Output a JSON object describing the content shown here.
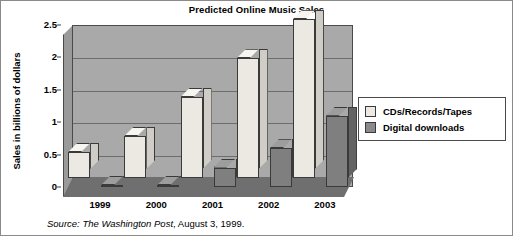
{
  "chart_data": {
    "type": "bar",
    "title": "Predicted Online Music Sales",
    "xlabel": "",
    "ylabel": "Sales in billions of dollars",
    "categories": [
      "1999",
      "2000",
      "2001",
      "2002",
      "2003"
    ],
    "series": [
      {
        "name": "CDs/Records/Tapes",
        "values": [
          0.4,
          0.65,
          1.25,
          1.85,
          2.45
        ],
        "color": "#ebe9e2"
      },
      {
        "name": "Digital downloads",
        "values": [
          0.02,
          0.03,
          0.3,
          0.6,
          1.1
        ],
        "color": "#7f7f7f"
      }
    ],
    "ylim": [
      0,
      2.5
    ],
    "yticks": [
      "0",
      "0.5",
      "1",
      "1.5",
      "2",
      "2.5"
    ],
    "ytick_values": [
      0,
      0.5,
      1,
      1.5,
      2,
      2.5
    ],
    "grid": true,
    "legend_position": "right",
    "style": "3d-column",
    "plot_background": "#a9a9a9"
  },
  "source": {
    "italic_part": "Source: The Washington Post",
    "rest_part": ", August 3, 1999."
  }
}
